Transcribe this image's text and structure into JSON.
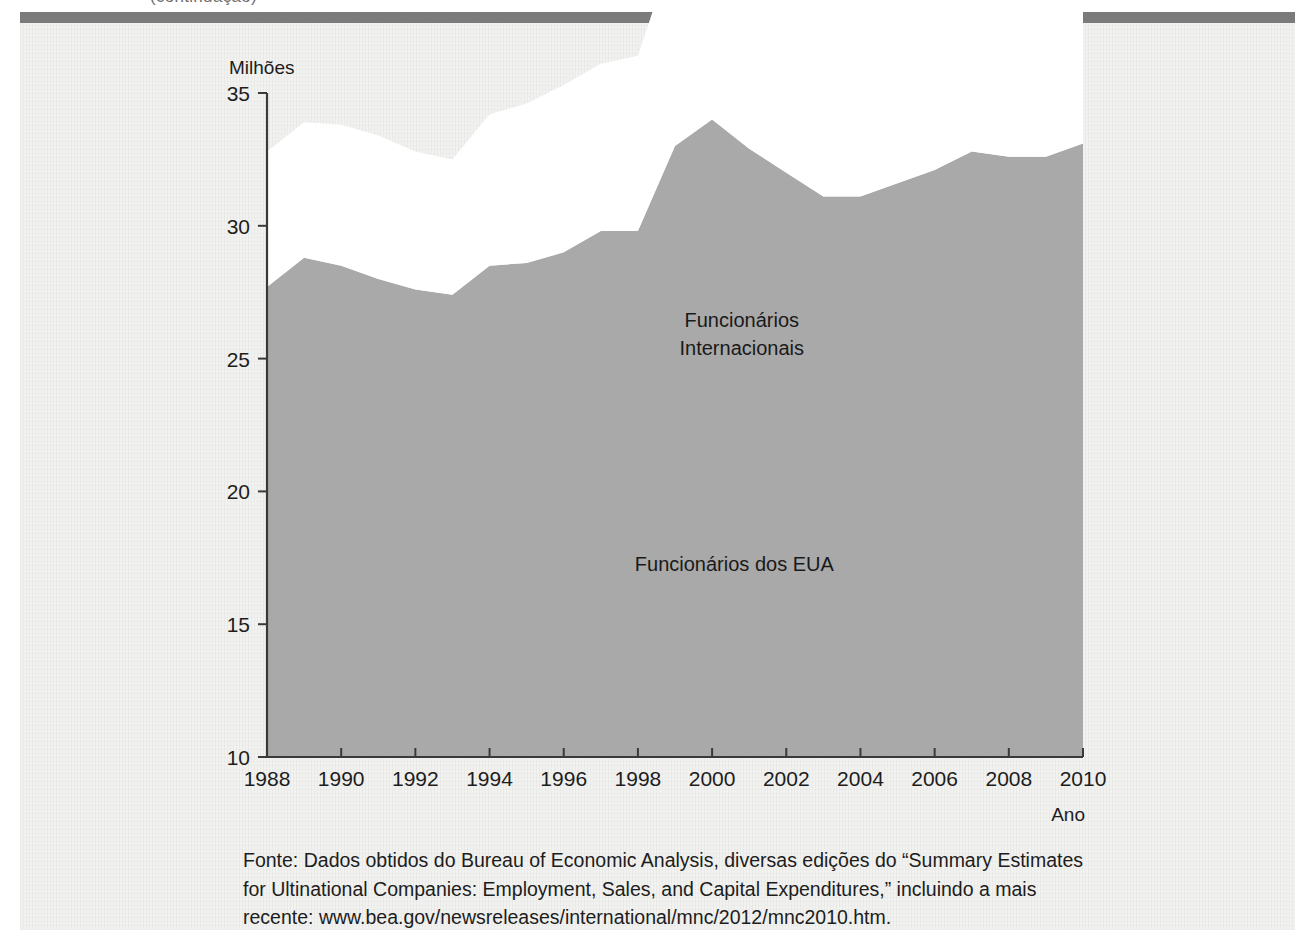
{
  "figure": {
    "cropped_header_text": "(continuação)",
    "y_axis_unit": "Milhões",
    "x_axis_name": "Ano"
  },
  "source_note": {
    "lines": [
      "Fonte: Dados obtidos do Bureau of Economic Analysis, diversas edições do “Summary Estimates",
      "for Ultinational Companies: Employment, Sales, and Capital Expenditures,” incluindo a mais",
      "recente: www.bea.gov/newsreleases/international/mnc/2012/mnc2010.htm."
    ]
  },
  "colors": {
    "us_area_fill": "#a9a9a9",
    "international_area_fill": "#ffffff",
    "panel_background": "#f2f2f0",
    "axis": "#3a3a3a",
    "top_rule": "#7b7b7b"
  },
  "chart_data": {
    "type": "area",
    "stacked": true,
    "title": "",
    "xlabel": "Ano",
    "ylabel": "Milhões",
    "grid": false,
    "legend_position": "in-plot-annotations",
    "xlim": [
      1988,
      2010
    ],
    "ylim": [
      10,
      35
    ],
    "yticks": [
      10,
      15,
      20,
      25,
      30,
      35
    ],
    "xticks": [
      1988,
      1990,
      1992,
      1994,
      1996,
      1998,
      2000,
      2002,
      2004,
      2006,
      2008,
      2010
    ],
    "x": [
      1988,
      1989,
      1990,
      1991,
      1992,
      1993,
      1994,
      1995,
      1996,
      1997,
      1998,
      1999,
      2000,
      2001,
      2002,
      2003,
      2004,
      2005,
      2006,
      2007,
      2008,
      2009,
      2010
    ],
    "series": [
      {
        "name": "Funcionários dos EUA",
        "fill": "#a9a9a9",
        "values": [
          17.7,
          18.8,
          18.5,
          18.0,
          17.6,
          17.4,
          18.5,
          18.6,
          19.0,
          19.8,
          19.8,
          23.0,
          24.0,
          22.9,
          22.0,
          21.1,
          21.1,
          21.6,
          22.1,
          22.8,
          22.6,
          22.6,
          23.1
        ],
        "label": {
          "text": "Funcionários dos EUA",
          "x_year": 2000.6,
          "y_value": 17.0,
          "lines": [
            "Funcionários dos EUA"
          ]
        }
      },
      {
        "name": "Funcionários Internacionais",
        "fill": "#ffffff",
        "values": [
          5.1,
          5.1,
          5.3,
          5.4,
          5.2,
          5.1,
          5.7,
          6.0,
          6.3,
          6.3,
          6.6,
          7.6,
          7.9,
          7.7,
          7.6,
          8.4,
          9.0,
          9.4,
          9.9,
          10.3,
          10.8,
          10.5,
          10.9
        ],
        "label": {
          "text": "Funcionários Internacionais",
          "x_year": 2000.8,
          "y_value": 26.2,
          "lines": [
            "Funcionários",
            "Internacionais"
          ]
        }
      }
    ],
    "totals": [
      22.8,
      23.9,
      23.8,
      23.4,
      22.8,
      22.5,
      24.2,
      24.6,
      25.3,
      26.1,
      26.4,
      30.6,
      31.9,
      30.6,
      29.6,
      29.5,
      30.1,
      31.0,
      32.0,
      33.1,
      33.4,
      33.1,
      34.0
    ]
  }
}
